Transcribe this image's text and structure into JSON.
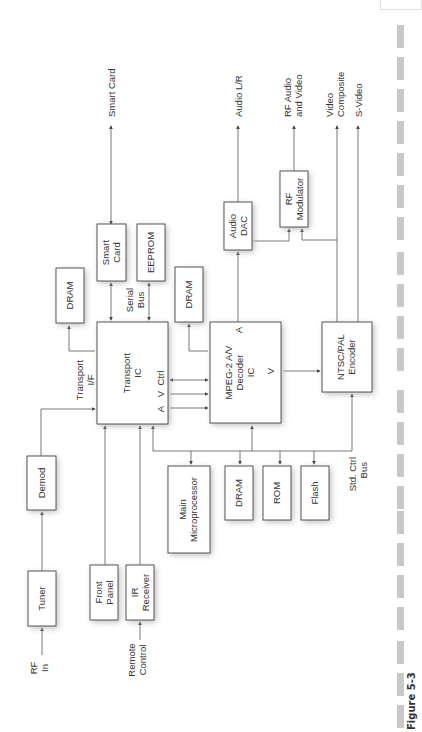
{
  "figure": {
    "caption": "Figure 5-3"
  },
  "blocks": {
    "tuner": "Tuner",
    "demod": "Demod",
    "front_panel": [
      "Front",
      "Panel"
    ],
    "ir_receiver": [
      "IR",
      "Receiver"
    ],
    "transport_ic": [
      "Transport",
      "IC"
    ],
    "transport_ports": {
      "a": "A",
      "v": "V",
      "ctrl": "Ctrl"
    },
    "dram_transport": "DRAM",
    "smart_card": [
      "Smart",
      "Card"
    ],
    "eeprom": "EEPROM",
    "dram_decoder": "DRAM",
    "mpeg_decoder": [
      "MPEG-2 A/V",
      "Decoder",
      "IC"
    ],
    "mpeg_ports": {
      "a": "A",
      "v": "V"
    },
    "audio_dac": [
      "Audio",
      "DAC"
    ],
    "rf_modulator": [
      "RF",
      "Modulator"
    ],
    "ntsc_pal_encoder": [
      "NTSC/PAL",
      "Encoder"
    ],
    "main_microprocessor": [
      "Main",
      "Microprocessor"
    ],
    "dram_bus": "DRAM",
    "rom": "ROM",
    "flash": "Flash"
  },
  "signals": {
    "rf_in": [
      "RF",
      "In"
    ],
    "remote_control": [
      "Remote",
      "Control"
    ],
    "transport_if": [
      "Transport",
      "I/F"
    ],
    "serial_bus": [
      "Serial",
      "Bus"
    ],
    "std_ctrl_bus": [
      "Std. Ctrl",
      "Bus"
    ],
    "smart_card_out": "Smart Card",
    "audio_lr": "Audio L/R",
    "rf_audio_video": [
      "RF Audio",
      "and Video"
    ],
    "video_composite": [
      "Video",
      "Composite"
    ],
    "s_video": "S-Video"
  }
}
